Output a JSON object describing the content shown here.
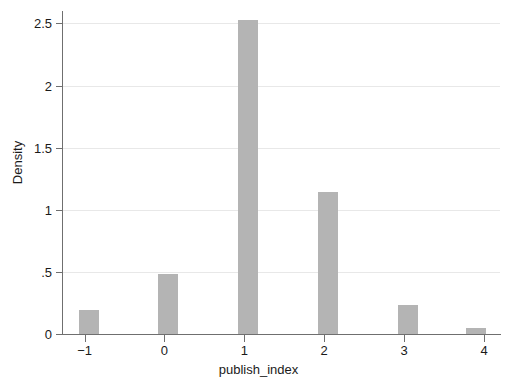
{
  "chart_data": {
    "type": "bar",
    "title": "",
    "subtitle": "",
    "xlabel": "publish_index",
    "ylabel": "Density",
    "x": [
      -1,
      0,
      1,
      2,
      3,
      3.85
    ],
    "values": [
      0.19,
      0.48,
      2.53,
      1.14,
      0.235,
      0.05
    ],
    "categories": [
      "-1",
      "0",
      "1",
      "2",
      "3",
      "3.85"
    ],
    "bar_width_units": 0.25,
    "bar_align": "right-edge-at-value-plus-0.17",
    "xlim": [
      -1.27,
      4.2
    ],
    "ylim": [
      0,
      2.6
    ],
    "xticks": [
      -1,
      0,
      1,
      2,
      3,
      4
    ],
    "xticklabels": [
      "−1",
      "0",
      "1",
      "2",
      "3",
      "4"
    ],
    "yticks": [
      0,
      0.5,
      1,
      1.5,
      2,
      2.5
    ],
    "yticklabels": [
      "0",
      ".5",
      "1",
      "1.5",
      "2",
      "2.5"
    ],
    "grid": "horizontal",
    "legend": "none",
    "bar_color": "#b4b4b4",
    "grid_color": "#e8e8e8",
    "axis_color": "#6f6f6f",
    "background": "#ffffff"
  }
}
